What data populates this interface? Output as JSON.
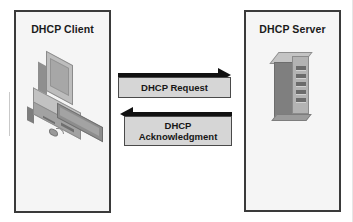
{
  "diagram": {
    "background_color": "#ffffff",
    "endpoints": [
      {
        "id": "client",
        "label": "DHCP Client",
        "icon": "desktop-computer-icon",
        "fill_color": "#f5f5f5",
        "border_color": "#3a3a3a"
      },
      {
        "id": "server",
        "label": "DHCP Server",
        "icon": "server-tower-icon",
        "fill_color": "#f5f5f5",
        "border_color": "#3a3a3a"
      }
    ],
    "messages": [
      {
        "id": "request",
        "label": "DHCP Request",
        "direction": "client-to-server",
        "arrow_color": "#111111",
        "box_fill": "#d6d6d6",
        "box_border": "#4a4a4a"
      },
      {
        "id": "acknowledgment",
        "label_line_1": "DHCP",
        "label_line_2": "Acknowledgment",
        "direction": "server-to-client",
        "arrow_color": "#111111",
        "box_fill": "#d6d6d6",
        "box_border": "#4a4a4a"
      }
    ]
  }
}
